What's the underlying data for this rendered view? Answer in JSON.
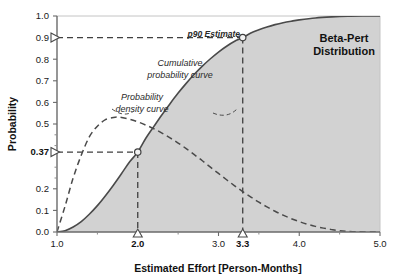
{
  "chart_data": {
    "type": "line",
    "title": "Beta-Pert Distribution",
    "title_line1": "Beta-Pert",
    "title_line2": "Distribution",
    "xlabel": "Estimated Effort [Person-Months]",
    "ylabel": "Probability",
    "xlim": [
      1.0,
      5.0
    ],
    "ylim": [
      0.0,
      1.0
    ],
    "grid": false,
    "legend_position": "inline-annotations",
    "xticks": [
      {
        "value": 1.0,
        "label": "1.0",
        "bold": false
      },
      {
        "value": 2.0,
        "label": "2.0",
        "bold": true
      },
      {
        "value": 3.0,
        "label": "3.0",
        "bold": false
      },
      {
        "value": 3.3,
        "label": "3.3",
        "bold": true
      },
      {
        "value": 4.0,
        "label": "4.0",
        "bold": false
      },
      {
        "value": 5.0,
        "label": "5.0",
        "bold": false
      }
    ],
    "xminorticks": [
      1.5,
      2.5,
      3.5,
      4.5
    ],
    "yticks": [
      {
        "value": 1.0,
        "label": "1.0",
        "bold": false
      },
      {
        "value": 0.9,
        "label": "0.9",
        "bold": false
      },
      {
        "value": 0.8,
        "label": "0.8",
        "bold": false
      },
      {
        "value": 0.7,
        "label": "0.7",
        "bold": false
      },
      {
        "value": 0.6,
        "label": "0.6",
        "bold": false
      },
      {
        "value": 0.5,
        "label": "0.5",
        "bold": false
      },
      {
        "value": 0.37,
        "label": "0.37",
        "bold": true
      },
      {
        "value": 0.2,
        "label": "0.2",
        "bold": false
      },
      {
        "value": 0.1,
        "label": "0.1",
        "bold": false
      },
      {
        "value": 0.0,
        "label": "0.0",
        "bold": false
      }
    ],
    "yminorticks": [
      0.45,
      0.4,
      0.3,
      0.25
    ],
    "series": [
      {
        "name": "Cumulative probability curve",
        "style": "solid",
        "color": "#4a4a4a",
        "filled_under": true,
        "fill_color": "#d2d2d2",
        "x": [
          1.0,
          1.1,
          1.2,
          1.3,
          1.4,
          1.5,
          1.6,
          1.7,
          1.8,
          1.9,
          2.0,
          2.1,
          2.2,
          2.3,
          2.4,
          2.5,
          2.6,
          2.7,
          2.8,
          2.9,
          3.0,
          3.1,
          3.2,
          3.3,
          3.4,
          3.5,
          3.6,
          3.7,
          3.8,
          3.9,
          4.0,
          4.2,
          4.4,
          4.6,
          4.8,
          5.0
        ],
        "y": [
          0.0,
          0.006,
          0.023,
          0.048,
          0.082,
          0.122,
          0.168,
          0.218,
          0.271,
          0.325,
          0.37,
          0.434,
          0.489,
          0.543,
          0.594,
          0.643,
          0.688,
          0.73,
          0.768,
          0.802,
          0.833,
          0.86,
          0.883,
          0.9,
          0.921,
          0.936,
          0.949,
          0.96,
          0.969,
          0.976,
          0.982,
          0.991,
          0.996,
          0.999,
          1.0,
          1.0
        ]
      },
      {
        "name": "Probability density curve",
        "style": "dashed",
        "color": "#4a4a4a",
        "filled_under": false,
        "x": [
          1.0,
          1.1,
          1.2,
          1.3,
          1.4,
          1.5,
          1.6,
          1.7,
          1.75,
          1.8,
          1.9,
          2.0,
          2.1,
          2.2,
          2.3,
          2.4,
          2.5,
          2.6,
          2.7,
          2.8,
          2.9,
          3.0,
          3.1,
          3.2,
          3.3,
          3.4,
          3.5,
          3.6,
          3.7,
          3.8,
          3.9,
          4.0,
          4.1,
          4.2,
          4.3,
          4.4,
          4.5,
          4.7,
          5.0
        ],
        "y": [
          0.0,
          0.12,
          0.25,
          0.355,
          0.44,
          0.49,
          0.52,
          0.53,
          0.532,
          0.53,
          0.522,
          0.51,
          0.495,
          0.478,
          0.458,
          0.436,
          0.412,
          0.386,
          0.358,
          0.33,
          0.3,
          0.271,
          0.242,
          0.214,
          0.187,
          0.162,
          0.138,
          0.116,
          0.096,
          0.078,
          0.062,
          0.048,
          0.036,
          0.026,
          0.018,
          0.011,
          0.006,
          0.001,
          0.0
        ]
      }
    ],
    "annotations": [
      {
        "name": "p90-estimate",
        "text": "p90 Estimate",
        "x": 3.3,
        "y": 0.9
      },
      {
        "name": "cumulative-probability-curve",
        "text_line1": "Cumulative",
        "text_line2": "probability curve",
        "x": 2.15,
        "y": 0.76
      },
      {
        "name": "probability-density-curve",
        "text_line1": "Probability",
        "text_line2": "density curve",
        "x": 1.72,
        "y": 0.6
      }
    ],
    "markers": [
      {
        "name": "p90-point",
        "x": 3.3,
        "y": 0.9,
        "shape": "circle"
      },
      {
        "name": "p37-point",
        "x": 2.0,
        "y": 0.37,
        "shape": "circle"
      }
    ],
    "guide_lines": [
      {
        "name": "p90-horizontal-guide",
        "from": [
          1.0,
          0.9
        ],
        "to": [
          3.3,
          0.9
        ]
      },
      {
        "name": "p90-vertical-guide",
        "from": [
          3.3,
          0.9
        ],
        "to": [
          3.3,
          0.0
        ]
      },
      {
        "name": "p37-horizontal-guide",
        "from": [
          1.0,
          0.37
        ],
        "to": [
          2.0,
          0.37
        ]
      },
      {
        "name": "p37-vertical-guide",
        "from": [
          2.0,
          0.37
        ],
        "to": [
          2.0,
          0.0
        ]
      }
    ],
    "axis_pointers": [
      {
        "name": "y-pointer-0.9",
        "axis": "y",
        "value": 0.9,
        "shape": "triangle-right"
      },
      {
        "name": "y-pointer-0.37",
        "axis": "y",
        "value": 0.37,
        "shape": "triangle-right"
      },
      {
        "name": "x-pointer-2.0",
        "axis": "x",
        "value": 2.0,
        "shape": "triangle-up"
      },
      {
        "name": "x-pointer-3.3",
        "axis": "x",
        "value": 3.3,
        "shape": "triangle-up"
      }
    ],
    "colors": {
      "fill": "#d2d2d2",
      "curve": "#4a4a4a",
      "axis": "#6a6a6a",
      "text": "#111111",
      "background": "#ffffff"
    }
  }
}
